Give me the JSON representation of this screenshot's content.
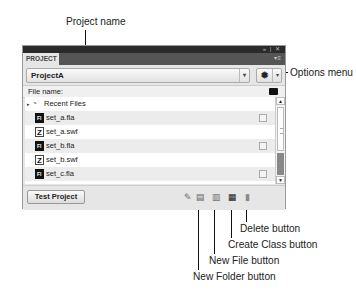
{
  "callouts": {
    "project_name": "Project name",
    "options_menu": "Options menu",
    "delete_button": "Delete button",
    "create_class_button": "Create Class button",
    "new_file_button": "New File button",
    "new_folder_button": "New Folder button"
  },
  "panel": {
    "titlebar_controls": "» | ✕",
    "tab_label": "PROJECT",
    "panel_menu": "▾≡",
    "project_select": {
      "value": "ProjectA",
      "dropdown_glyph": "▾"
    },
    "options": {
      "gear_glyph": "✹",
      "dropdown_glyph": "▾"
    },
    "file_name_label": "File name:",
    "recent_files": {
      "label": "Recent Files",
      "expand_glyph": "▸",
      "icon_glyph": "◔"
    },
    "files": [
      {
        "name": "set_a.fla",
        "type": "fla"
      },
      {
        "name": "set_a.swf",
        "type": "swf"
      },
      {
        "name": "set_b.fla",
        "type": "fla"
      },
      {
        "name": "set_b.swf",
        "type": "swf"
      },
      {
        "name": "set_c.fla",
        "type": "fla"
      }
    ],
    "scrollbar": {
      "up": "▲",
      "down": "▼"
    },
    "test_project_label": "Test Project",
    "tools": {
      "edit": "✎",
      "new_folder": "▤",
      "new_file": "▥",
      "create_class": "▦",
      "delete": "▮"
    }
  }
}
